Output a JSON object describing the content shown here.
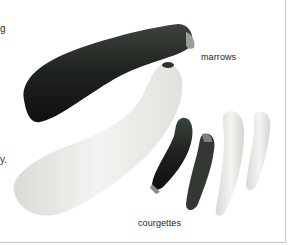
{
  "page": {
    "left_edge_text": [
      {
        "text": "g",
        "top": 24
      },
      {
        "text": "y.",
        "top": 155
      }
    ],
    "figure": {
      "description": "Photograph of marrows and courgettes",
      "labels": {
        "marrows": "marrows",
        "courgettes": "courgettes"
      },
      "items": [
        {
          "name": "dark-marrow",
          "color": "#1e221e"
        },
        {
          "name": "pale-marrow",
          "color": "#eceee9"
        },
        {
          "name": "dark-courgette-1",
          "color": "#2a302a"
        },
        {
          "name": "dark-courgette-2",
          "color": "#3a403a"
        },
        {
          "name": "pale-courgette-1",
          "color": "#e8ebe5"
        },
        {
          "name": "pale-courgette-2",
          "color": "#e4e7e1"
        }
      ]
    }
  }
}
